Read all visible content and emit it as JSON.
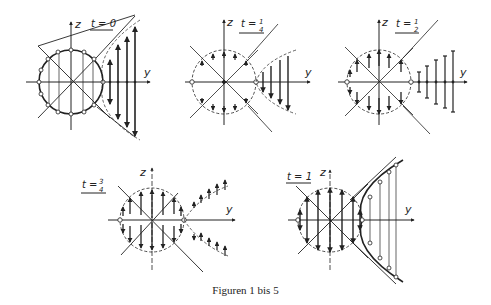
{
  "caption": "Figuren 1 bis 5",
  "figures": [
    {
      "id": "fig1",
      "t_label": "t = 0",
      "t_num": "",
      "t_den": "",
      "axis_z": "z",
      "axis_y": "y"
    },
    {
      "id": "fig2",
      "t_label": "t =",
      "t_num": "1",
      "t_den": "4",
      "axis_z": "z",
      "axis_y": "y"
    },
    {
      "id": "fig3",
      "t_label": "t =",
      "t_num": "1",
      "t_den": "2",
      "axis_z": "z",
      "axis_y": "y"
    },
    {
      "id": "fig4",
      "t_label": "t =",
      "t_num": "3",
      "t_den": "4",
      "axis_z": "z",
      "axis_y": "y"
    },
    {
      "id": "fig5",
      "t_label": "t = 1",
      "t_num": "",
      "t_den": "",
      "axis_z": "z",
      "axis_y": "y"
    }
  ],
  "colors": {
    "ink": "#222222",
    "background": "#ffffff"
  }
}
